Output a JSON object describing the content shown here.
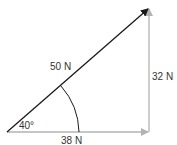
{
  "diagram": {
    "type": "vector-triangle",
    "resultant": {
      "label": "50 N",
      "color": "#1a1a1a"
    },
    "vertical_component": {
      "label": "32 N",
      "color": "#b3b3b3"
    },
    "horizontal_component": {
      "label": "38 N",
      "color": "#b3b3b3"
    },
    "angle": {
      "label": "40°"
    }
  }
}
